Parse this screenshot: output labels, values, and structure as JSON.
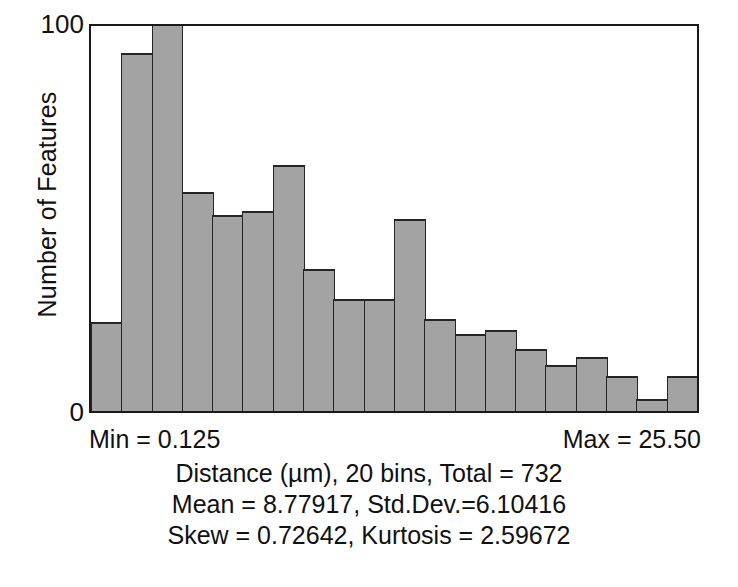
{
  "chart_data": {
    "type": "bar",
    "title": "",
    "xlabel": "Distance (µm), 20 bins, Total = 732",
    "ylabel": "Number of Features",
    "ylim": [
      0,
      100
    ],
    "yticks": [
      "0",
      "100"
    ],
    "xlim": [
      0.125,
      25.5
    ],
    "grid": false,
    "legend": null,
    "bins": 20,
    "categories": [
      "bin-1",
      "bin-2",
      "bin-3",
      "bin-4",
      "bin-5",
      "bin-6",
      "bin-7",
      "bin-8",
      "bin-9",
      "bin-10",
      "bin-11",
      "bin-12",
      "bin-13",
      "bin-14",
      "bin-15",
      "bin-16",
      "bin-17",
      "bin-18",
      "bin-19",
      "bin-20"
    ],
    "values": [
      23,
      93,
      102,
      57,
      51,
      52,
      64,
      37,
      29,
      29,
      50,
      24,
      20,
      21,
      16,
      12,
      14,
      9,
      3,
      9
    ],
    "note_clipped_bars": "bin-3 exceeds the 100 axis maximum and is drawn clipped at the frame top",
    "bar_fill_color": "#a3a3a3",
    "bar_edge_color": "#262626",
    "frame_color": "#1a1a1a",
    "background_color": "#ffffff"
  },
  "axis": {
    "y_title": "Number of Features",
    "y_tick_top": "100",
    "y_tick_zero": "0"
  },
  "range_labels": {
    "min": "Min = 0.125",
    "max": "Max = 25.50"
  },
  "caption": {
    "line1": "Distance (µm), 20 bins, Total = 732",
    "line2": "Mean = 8.77917, Std.Dev.=6.10416",
    "line3": "Skew = 0.72642, Kurtosis = 2.59672"
  },
  "stats": {
    "min": 0.125,
    "max": 25.5,
    "bins": 20,
    "total": 732,
    "mean": 8.77917,
    "std_dev": 6.10416,
    "skew": 0.72642,
    "kurtosis": 2.59672,
    "units": "µm",
    "variable": "Distance"
  }
}
